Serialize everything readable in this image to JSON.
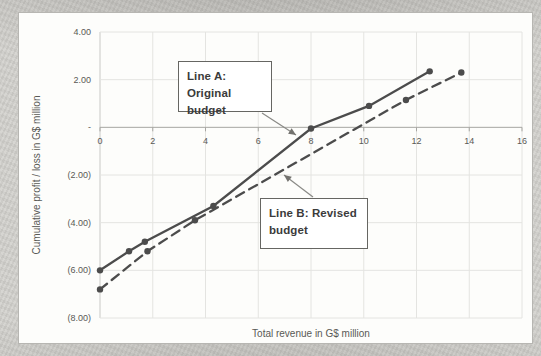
{
  "chart_data": {
    "type": "line",
    "title": "",
    "xlabel": "Total revenue in G$ million",
    "ylabel": "Cumulative profit / loss in G$ million",
    "grid": true,
    "legend": "none",
    "x_axis": {
      "min": 0,
      "max": 16,
      "step": 2,
      "tick_values": [
        0,
        2,
        4,
        6,
        8,
        10,
        12,
        14,
        16
      ],
      "tick_labels": [
        "0",
        "2",
        "4",
        "6",
        "8",
        "10",
        "12",
        "14",
        "16"
      ]
    },
    "y_axis": {
      "min": -8,
      "max": 4,
      "step": 2,
      "tick_values": [
        4,
        2,
        0,
        -2,
        -4,
        -6,
        -8
      ],
      "tick_labels": [
        "4.00",
        "2.00",
        "-",
        "(2.00)",
        "(4.00)",
        "(6.00)",
        "(8.00)"
      ]
    },
    "series": [
      {
        "name": "Line A: Original budget",
        "line_style": "solid",
        "marker": "circle",
        "color": "#4c4c4c",
        "points": [
          [
            0,
            -6.0
          ],
          [
            1.1,
            -5.2
          ],
          [
            1.7,
            -4.8
          ],
          [
            4.3,
            -3.3
          ],
          [
            8.0,
            -0.05
          ],
          [
            10.2,
            0.9
          ],
          [
            12.5,
            2.35
          ]
        ]
      },
      {
        "name": "Line B: Revised budget",
        "line_style": "dashed",
        "marker": "circle",
        "color": "#4c4c4c",
        "points": [
          [
            0,
            -6.8
          ],
          [
            1.8,
            -5.2
          ],
          [
            3.6,
            -3.9
          ],
          [
            11.6,
            1.15
          ],
          [
            13.7,
            2.3
          ]
        ]
      }
    ],
    "annotations": [
      {
        "line1": "Line A: Original",
        "line2": "budget",
        "box": {
          "left": 178,
          "top": 61,
          "width": 94,
          "height": 51
        },
        "arrow": {
          "x1": 262,
          "y1": 113,
          "x2": 296,
          "y2": 135
        }
      },
      {
        "line1": "Line B: Revised",
        "line2": "budget",
        "box": {
          "left": 260,
          "top": 198,
          "width": 108,
          "height": 51
        },
        "arrow": {
          "x1": 313,
          "y1": 197,
          "x2": 284,
          "y2": 175
        }
      }
    ],
    "colors": {
      "line": "#4c4c4c",
      "gridline": "#e4e4e1",
      "zero_axis": "#a7a6a2",
      "tick_text": "#595955",
      "arrow": "#8a8a86",
      "callout_border": "#666662"
    }
  }
}
